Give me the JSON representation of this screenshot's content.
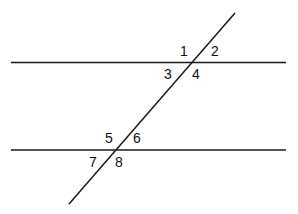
{
  "diagram": {
    "line_color": "#1a1a1a",
    "parallel_lines": [
      {
        "id": "top",
        "x1": 11,
        "y1": 62.5,
        "x2": 286,
        "y2": 62.5
      },
      {
        "id": "bottom",
        "x1": 11,
        "y1": 150,
        "x2": 286,
        "y2": 150
      }
    ],
    "transversal": {
      "x1": 235,
      "y1": 13,
      "x2": 69,
      "y2": 204
    },
    "angles": [
      {
        "label": "1",
        "x": 180,
        "y": 44
      },
      {
        "label": "2",
        "x": 211,
        "y": 44
      },
      {
        "label": "3",
        "x": 164,
        "y": 67
      },
      {
        "label": "4",
        "x": 192,
        "y": 67
      },
      {
        "label": "5",
        "x": 105,
        "y": 131
      },
      {
        "label": "6",
        "x": 133,
        "y": 131
      },
      {
        "label": "7",
        "x": 89,
        "y": 155
      },
      {
        "label": "8",
        "x": 115,
        "y": 155
      }
    ]
  }
}
